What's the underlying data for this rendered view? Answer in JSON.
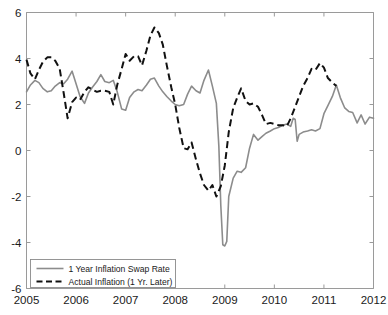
{
  "chart_data": {
    "type": "line",
    "title": "",
    "subtitle": "",
    "xlabel": "",
    "ylabel": "",
    "xlim": [
      2005,
      2012
    ],
    "ylim": [
      -6,
      6
    ],
    "grid": false,
    "legend_position": "bottom-left",
    "x_ticks": [
      "2005",
      "2006",
      "2007",
      "2008",
      "2009",
      "2010",
      "2011",
      "2012"
    ],
    "x_tick_values": [
      2005,
      2006,
      2007,
      2008,
      2009,
      2010,
      2011,
      2012
    ],
    "y_ticks": [
      "6",
      "4",
      "2",
      "0",
      "-2",
      "-4",
      "-6"
    ],
    "y_tick_values": [
      6,
      4,
      2,
      0,
      -2,
      -4,
      -6
    ],
    "series": [
      {
        "name": "1 Year Inflation Swap Rate",
        "style": "solid",
        "color": "#8c8c8c",
        "points": [
          [
            2005.0,
            2.55
          ],
          [
            2005.08,
            2.85
          ],
          [
            2005.17,
            3.05
          ],
          [
            2005.25,
            2.95
          ],
          [
            2005.33,
            2.7
          ],
          [
            2005.42,
            2.55
          ],
          [
            2005.5,
            2.6
          ],
          [
            2005.58,
            2.8
          ],
          [
            2005.67,
            2.95
          ],
          [
            2005.75,
            2.9
          ],
          [
            2005.83,
            3.1
          ],
          [
            2005.92,
            3.45
          ],
          [
            2006.0,
            2.9
          ],
          [
            2006.08,
            2.35
          ],
          [
            2006.17,
            2.05
          ],
          [
            2006.25,
            2.5
          ],
          [
            2006.33,
            2.75
          ],
          [
            2006.42,
            3.0
          ],
          [
            2006.5,
            3.3
          ],
          [
            2006.58,
            3.0
          ],
          [
            2006.67,
            2.95
          ],
          [
            2006.75,
            3.05
          ],
          [
            2006.83,
            2.55
          ],
          [
            2006.92,
            1.8
          ],
          [
            2007.0,
            1.75
          ],
          [
            2007.08,
            2.3
          ],
          [
            2007.17,
            2.55
          ],
          [
            2007.25,
            2.65
          ],
          [
            2007.33,
            2.6
          ],
          [
            2007.42,
            2.85
          ],
          [
            2007.5,
            3.1
          ],
          [
            2007.58,
            3.15
          ],
          [
            2007.67,
            2.8
          ],
          [
            2007.75,
            2.55
          ],
          [
            2007.83,
            2.35
          ],
          [
            2007.92,
            2.15
          ],
          [
            2008.0,
            2.0
          ],
          [
            2008.08,
            1.95
          ],
          [
            2008.17,
            2.0
          ],
          [
            2008.25,
            2.45
          ],
          [
            2008.33,
            2.8
          ],
          [
            2008.42,
            2.6
          ],
          [
            2008.5,
            2.5
          ],
          [
            2008.58,
            3.05
          ],
          [
            2008.67,
            3.5
          ],
          [
            2008.75,
            2.8
          ],
          [
            2008.83,
            2.05
          ],
          [
            2008.88,
            0.2
          ],
          [
            2008.92,
            -2.4
          ],
          [
            2008.96,
            -4.1
          ],
          [
            2009.0,
            -4.15
          ],
          [
            2009.04,
            -3.95
          ],
          [
            2009.08,
            -2.0
          ],
          [
            2009.17,
            -1.2
          ],
          [
            2009.25,
            -0.9
          ],
          [
            2009.33,
            -0.95
          ],
          [
            2009.42,
            -0.75
          ],
          [
            2009.5,
            0.1
          ],
          [
            2009.58,
            0.7
          ],
          [
            2009.67,
            0.45
          ],
          [
            2009.75,
            0.6
          ],
          [
            2009.83,
            0.75
          ],
          [
            2009.92,
            0.85
          ],
          [
            2010.0,
            0.95
          ],
          [
            2010.08,
            1.0
          ],
          [
            2010.17,
            1.1
          ],
          [
            2010.25,
            1.15
          ],
          [
            2010.33,
            1.05
          ],
          [
            2010.38,
            1.4
          ],
          [
            2010.42,
            1.35
          ],
          [
            2010.46,
            0.4
          ],
          [
            2010.5,
            0.7
          ],
          [
            2010.58,
            0.8
          ],
          [
            2010.67,
            0.85
          ],
          [
            2010.75,
            0.9
          ],
          [
            2010.83,
            0.85
          ],
          [
            2010.92,
            0.95
          ],
          [
            2011.0,
            1.6
          ],
          [
            2011.08,
            1.95
          ],
          [
            2011.17,
            2.35
          ],
          [
            2011.25,
            2.85
          ],
          [
            2011.33,
            2.3
          ],
          [
            2011.42,
            1.85
          ],
          [
            2011.5,
            1.7
          ],
          [
            2011.58,
            1.65
          ],
          [
            2011.67,
            1.2
          ],
          [
            2011.75,
            1.55
          ],
          [
            2011.83,
            1.15
          ],
          [
            2011.92,
            1.45
          ],
          [
            2012.0,
            1.4
          ]
        ]
      },
      {
        "name": "Actual Inflation (1 Yr. Later)",
        "style": "dashed",
        "color": "#111111",
        "points": [
          [
            2005.0,
            3.95
          ],
          [
            2005.08,
            3.35
          ],
          [
            2005.17,
            3.1
          ],
          [
            2005.25,
            3.5
          ],
          [
            2005.33,
            3.85
          ],
          [
            2005.42,
            4.05
          ],
          [
            2005.5,
            4.05
          ],
          [
            2005.58,
            3.9
          ],
          [
            2005.67,
            3.55
          ],
          [
            2005.75,
            2.5
          ],
          [
            2005.83,
            1.4
          ],
          [
            2005.92,
            2.1
          ],
          [
            2006.0,
            2.3
          ],
          [
            2006.08,
            2.2
          ],
          [
            2006.17,
            2.55
          ],
          [
            2006.25,
            2.75
          ],
          [
            2006.33,
            2.65
          ],
          [
            2006.42,
            2.55
          ],
          [
            2006.5,
            2.6
          ],
          [
            2006.58,
            2.6
          ],
          [
            2006.67,
            2.55
          ],
          [
            2006.75,
            2.0
          ],
          [
            2006.83,
            2.85
          ],
          [
            2006.92,
            3.55
          ],
          [
            2007.0,
            4.2
          ],
          [
            2007.08,
            3.9
          ],
          [
            2007.17,
            4.1
          ],
          [
            2007.25,
            4.1
          ],
          [
            2007.33,
            3.7
          ],
          [
            2007.42,
            4.35
          ],
          [
            2007.5,
            5.0
          ],
          [
            2007.58,
            5.35
          ],
          [
            2007.67,
            5.1
          ],
          [
            2007.75,
            4.6
          ],
          [
            2007.83,
            3.7
          ],
          [
            2007.92,
            2.75
          ],
          [
            2008.0,
            2.0
          ],
          [
            2008.08,
            1.0
          ],
          [
            2008.17,
            0.1
          ],
          [
            2008.25,
            0.05
          ],
          [
            2008.33,
            0.35
          ],
          [
            2008.42,
            -0.4
          ],
          [
            2008.5,
            -1.0
          ],
          [
            2008.58,
            -1.5
          ],
          [
            2008.67,
            -1.75
          ],
          [
            2008.75,
            -1.5
          ],
          [
            2008.83,
            -2.0
          ],
          [
            2008.92,
            -1.55
          ],
          [
            2009.0,
            -0.65
          ],
          [
            2009.08,
            0.8
          ],
          [
            2009.17,
            1.85
          ],
          [
            2009.25,
            2.3
          ],
          [
            2009.33,
            2.7
          ],
          [
            2009.42,
            2.15
          ],
          [
            2009.5,
            2.0
          ],
          [
            2009.58,
            2.05
          ],
          [
            2009.67,
            1.9
          ],
          [
            2009.75,
            1.55
          ],
          [
            2009.83,
            1.15
          ],
          [
            2009.92,
            1.2
          ],
          [
            2010.0,
            1.15
          ],
          [
            2010.08,
            1.1
          ],
          [
            2010.17,
            1.1
          ],
          [
            2010.25,
            1.05
          ],
          [
            2010.33,
            1.4
          ],
          [
            2010.42,
            1.9
          ],
          [
            2010.5,
            2.35
          ],
          [
            2010.58,
            2.8
          ],
          [
            2010.67,
            3.15
          ],
          [
            2010.75,
            3.55
          ],
          [
            2010.83,
            3.5
          ],
          [
            2010.92,
            3.8
          ],
          [
            2011.0,
            3.6
          ],
          [
            2011.08,
            3.15
          ],
          [
            2011.17,
            2.95
          ],
          [
            2011.25,
            2.8
          ]
        ]
      }
    ],
    "legend": [
      {
        "label": "1 Year Inflation Swap Rate",
        "style": "solid",
        "color": "#8c8c8c"
      },
      {
        "label": "Actual Inflation (1 Yr. Later)",
        "style": "dashed",
        "color": "#111111"
      }
    ]
  },
  "colors": {
    "background": "#ffffff",
    "axis": "#9a9a9a",
    "text": "#1a1a1a",
    "swap_series": "#8c8c8c",
    "actual_series": "#111111"
  }
}
